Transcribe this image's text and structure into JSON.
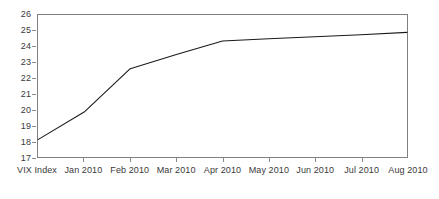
{
  "chart_data": {
    "type": "line",
    "title": "",
    "subtitle": "",
    "xlabel": "",
    "ylabel": "",
    "categories": [
      "VIX Index",
      "Jan 2010",
      "Feb 2010",
      "Mar 2010",
      "Apr 2010",
      "May 2010",
      "Jun 2010",
      "Jul 2010",
      "Aug 2010"
    ],
    "series": [
      {
        "name": "VIX Index",
        "values": [
          18.1,
          19.85,
          22.6,
          23.5,
          24.35,
          24.5,
          24.62,
          24.75,
          24.9
        ]
      }
    ],
    "yticks": [
      17,
      18,
      19,
      20,
      21,
      22,
      23,
      24,
      25,
      26
    ],
    "ytick_labels": [
      "17",
      "18",
      "19",
      "20",
      "21",
      "22",
      "23",
      "24",
      "25",
      "26"
    ],
    "ylim": [
      17,
      26
    ],
    "grid": false,
    "legend": false,
    "legend_position": "none",
    "line_color": "#1a1a1a",
    "axis_color": "#808080",
    "background_color": "#ffffff"
  }
}
